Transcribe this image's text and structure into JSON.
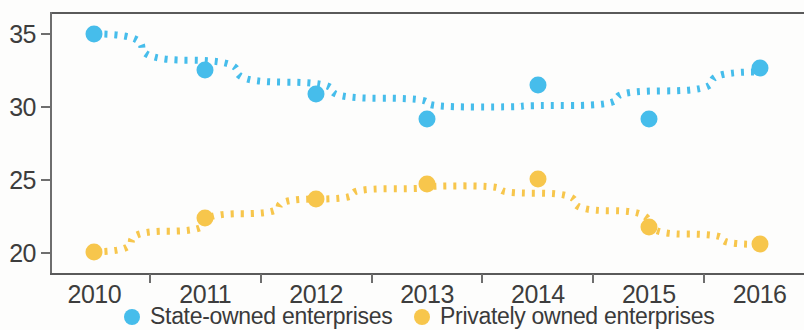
{
  "chart_data": {
    "type": "scatter",
    "title": "",
    "subtitle": "",
    "xlabel": "",
    "ylabel": "",
    "categories": [
      "2010",
      "2011",
      "2012",
      "2013",
      "2014",
      "2015",
      "2016"
    ],
    "x": [
      2010,
      2011,
      2012,
      2013,
      2014,
      2015,
      2016
    ],
    "ylim": [
      18.5,
      36.5
    ],
    "xlim": [
      2009.6,
      2016.4
    ],
    "yticks": [
      20,
      25,
      30,
      35
    ],
    "ytick_labels": [
      "20",
      "25",
      "30",
      "35"
    ],
    "xtick_labels": [
      "2010",
      "2011",
      "2012",
      "2013",
      "2014",
      "2015",
      "2016"
    ],
    "grid": false,
    "legend_position": "bottom",
    "markers": "circle",
    "trendline_style": "dotted",
    "series": [
      {
        "name": "State-owned enterprises",
        "color": "#46bdeb",
        "values": [
          35.0,
          32.5,
          30.9,
          29.2,
          31.5,
          29.2,
          32.7
        ],
        "trend": [
          35.0,
          33.2,
          31.7,
          30.6,
          30.0,
          30.1,
          31.1,
          32.4
        ]
      },
      {
        "name": "Privately owned enterprises",
        "color": "#f7c64c",
        "values": [
          20.1,
          22.4,
          23.7,
          24.7,
          25.1,
          21.8,
          20.6
        ],
        "trend": [
          20.1,
          21.5,
          22.7,
          23.7,
          24.4,
          24.6,
          24.1,
          22.9,
          21.3,
          20.6
        ]
      }
    ]
  },
  "legend": {
    "items": [
      {
        "label": "State-owned enterprises",
        "color": "#46bdeb"
      },
      {
        "label": "Privately owned enterprises",
        "color": "#f7c64c"
      }
    ]
  },
  "axes": {
    "y": {
      "ticks": [
        "35",
        "30",
        "25",
        "20"
      ]
    },
    "x": {
      "ticks": [
        "2010",
        "2011",
        "2012",
        "2013",
        "2014",
        "2015",
        "2016"
      ]
    }
  }
}
